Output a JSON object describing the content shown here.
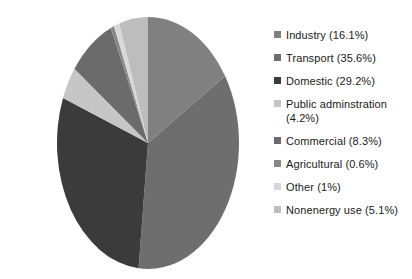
{
  "chart_data": {
    "type": "pie",
    "title": "",
    "legend_position": "right",
    "start_angle_deg": 0,
    "direction": "clockwise",
    "categories": [
      "Industry",
      "Transport",
      "Domestic",
      "Public adminstration",
      "Commercial",
      "Agricultural",
      "Other",
      "Nonenergy use"
    ],
    "values": [
      16.1,
      35.6,
      29.2,
      4.2,
      8.3,
      0.6,
      1.0,
      5.1
    ],
    "unit": "%",
    "colors": [
      "#808080",
      "#6e6e6e",
      "#3b3b3b",
      "#c6c6c6",
      "#6b6b6b",
      "#878787",
      "#d8d8d8",
      "#bdbdbd"
    ],
    "labels": [
      "Industry (16.1%)",
      "Transport (35.6%)",
      "Domestic (29.2%)",
      "Public adminstration\n(4.2%)",
      "Commercial (8.3%)",
      "Agricultural (0.6%)",
      "Other (1%)",
      "Nonenergy use (5.1%)"
    ],
    "xlabel": "",
    "ylabel": ""
  },
  "legend": {
    "items": [
      {
        "label": "Industry (16.1%)",
        "color": "#808080",
        "name": "industry"
      },
      {
        "label": "Transport (35.6%)",
        "color": "#6e6e6e",
        "name": "transport"
      },
      {
        "label": "Domestic (29.2%)",
        "color": "#3b3b3b",
        "name": "domestic"
      },
      {
        "label": "Public adminstration\n(4.2%)",
        "color": "#c6c6c6",
        "name": "public-adminstration"
      },
      {
        "label": "Commercial (8.3%)",
        "color": "#6b6b6b",
        "name": "commercial"
      },
      {
        "label": "Agricultural (0.6%)",
        "color": "#878787",
        "name": "agricultural"
      },
      {
        "label": "Other (1%)",
        "color": "#d8d8d8",
        "name": "other"
      },
      {
        "label": "Nonenergy use (5.1%)",
        "color": "#bdbdbd",
        "name": "nonenergy-use"
      }
    ]
  }
}
